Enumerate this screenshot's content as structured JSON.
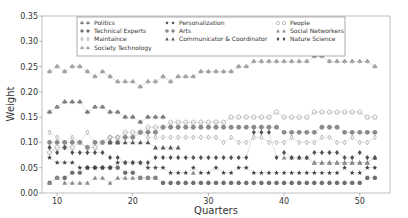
{
  "chart_data": {
    "type": "scatter",
    "title": "",
    "xlabel": "Quarters",
    "ylabel": "Weight",
    "xlim": [
      8,
      54
    ],
    "ylim": [
      0.0,
      0.35
    ],
    "xticks": [
      10,
      20,
      30,
      40,
      50
    ],
    "yticks": [
      0.0,
      0.05,
      0.1,
      0.15,
      0.2,
      0.25,
      0.3,
      0.35
    ],
    "ytick_labels": [
      "0.00",
      "0.05",
      "0.10",
      "0.15",
      "0.20",
      "0.25",
      "0.30",
      "0.35"
    ],
    "grid": false,
    "legend_position": "upper center",
    "x": [
      9,
      10,
      11,
      12,
      13,
      14,
      15,
      16,
      17,
      18,
      19,
      20,
      21,
      22,
      23,
      24,
      25,
      26,
      27,
      28,
      29,
      30,
      31,
      32,
      33,
      34,
      35,
      36,
      37,
      38,
      39,
      40,
      41,
      42,
      43,
      44,
      45,
      46,
      47,
      48,
      49,
      50,
      51,
      52
    ],
    "series": [
      {
        "name": "Politics",
        "marker": "club",
        "color": "#7a7a7a",
        "values": [
          0.16,
          0.17,
          0.18,
          0.18,
          0.18,
          0.16,
          0.17,
          0.17,
          0.16,
          0.16,
          0.15,
          0.15,
          0.14,
          0.15,
          0.15,
          0.15,
          null,
          null,
          null,
          null,
          null,
          null,
          null,
          null,
          null,
          null,
          null,
          null,
          null,
          null,
          null,
          null,
          null,
          null,
          null,
          null,
          null,
          null,
          null,
          null,
          null,
          null,
          null,
          null
        ]
      },
      {
        "name": "Technical Experts",
        "marker": "hexagon",
        "color": "#6e6e6e",
        "values": [
          0.02,
          0.03,
          0.03,
          0.04,
          0.04,
          0.05,
          0.05,
          0.05,
          0.05,
          0.05,
          0.04,
          0.04,
          0.03,
          0.03,
          0.03,
          0.02,
          0.02,
          0.02,
          0.02,
          0.02,
          0.02,
          0.02,
          0.02,
          0.02,
          0.02,
          0.02,
          0.02,
          0.02,
          0.02,
          0.02,
          0.02,
          0.02,
          0.02,
          0.02,
          0.02,
          0.02,
          0.02,
          0.02,
          0.02,
          0.02,
          0.02,
          0.02,
          0.03,
          0.03
        ]
      },
      {
        "name": "Maintaince",
        "marker": "thin-diamond",
        "color": "#999999",
        "values": [
          0.12,
          0.11,
          0.1,
          0.11,
          0.1,
          0.12,
          0.1,
          0.1,
          0.11,
          0.11,
          0.11,
          0.11,
          0.12,
          0.11,
          0.11,
          0.11,
          0.11,
          0.11,
          0.11,
          0.11,
          0.11,
          0.11,
          0.11,
          0.1,
          0.11,
          0.1,
          0.1,
          0.11,
          0.11,
          0.1,
          0.1,
          0.1,
          0.11,
          0.1,
          0.1,
          0.1,
          0.11,
          0.11,
          0.1,
          0.1,
          0.11,
          0.1,
          0.1,
          0.11
        ]
      },
      {
        "name": "Society Technology",
        "marker": "club-light",
        "color": "#a0a0a0",
        "values": [
          0.24,
          0.25,
          0.24,
          0.25,
          0.25,
          0.24,
          0.23,
          0.24,
          0.23,
          0.22,
          0.22,
          0.22,
          0.21,
          0.22,
          0.22,
          0.23,
          0.22,
          0.23,
          0.23,
          0.23,
          0.24,
          0.24,
          0.24,
          0.24,
          0.24,
          0.25,
          0.25,
          0.26,
          0.26,
          0.26,
          0.26,
          0.26,
          0.26,
          0.26,
          0.26,
          0.27,
          0.27,
          0.26,
          0.26,
          0.26,
          0.26,
          0.26,
          0.26,
          0.25
        ]
      },
      {
        "name": "Personalization",
        "marker": "star",
        "color": "#404040",
        "values": [
          0.07,
          0.06,
          0.06,
          0.06,
          0.05,
          0.05,
          0.05,
          0.05,
          0.05,
          0.06,
          0.06,
          0.06,
          0.06,
          0.05,
          0.05,
          0.05,
          0.04,
          0.04,
          0.04,
          0.05,
          0.04,
          0.04,
          0.05,
          0.04,
          0.04,
          0.05,
          0.05,
          0.04,
          0.04,
          0.04,
          0.04,
          0.04,
          0.04,
          0.04,
          0.04,
          0.04,
          0.04,
          0.04,
          0.04,
          0.05,
          0.04,
          0.04,
          0.05,
          0.05
        ]
      },
      {
        "name": "Arts",
        "marker": "circle",
        "color": "#8a8a8a",
        "values": [
          0.1,
          0.1,
          0.1,
          0.1,
          0.1,
          0.09,
          0.1,
          0.1,
          0.1,
          0.1,
          0.11,
          0.11,
          0.12,
          0.12,
          0.12,
          0.13,
          0.13,
          0.13,
          0.13,
          0.13,
          0.13,
          0.13,
          0.13,
          0.13,
          0.13,
          0.13,
          0.13,
          0.13,
          0.13,
          0.13,
          0.13,
          0.12,
          0.12,
          0.12,
          0.12,
          0.12,
          0.13,
          0.13,
          0.13,
          0.12,
          0.12,
          0.12,
          0.12,
          0.12
        ]
      },
      {
        "name": "Communicator & Coordinator",
        "marker": "triangle",
        "color": "#5a5a5a",
        "values": [
          null,
          null,
          null,
          null,
          null,
          null,
          null,
          null,
          0.1,
          0.1,
          0.1,
          0.1,
          0.1,
          0.1,
          0.09,
          0.09,
          0.09,
          0.09,
          null,
          null,
          null,
          null,
          null,
          null,
          null,
          null,
          null,
          null,
          null,
          null,
          null,
          null,
          null,
          null,
          null,
          0.06,
          0.06,
          0.06,
          0.06,
          0.06,
          0.06,
          0.06,
          0.06,
          0.07
        ]
      },
      {
        "name": "People",
        "marker": "pentagon-open",
        "color": "#aaaaaa",
        "values": [
          0.08,
          0.09,
          0.09,
          0.09,
          0.1,
          0.09,
          0.09,
          0.1,
          0.11,
          0.11,
          0.12,
          0.12,
          0.12,
          0.13,
          0.13,
          0.13,
          0.14,
          0.14,
          0.14,
          0.14,
          0.14,
          0.14,
          0.14,
          0.14,
          0.15,
          0.15,
          0.15,
          0.15,
          0.15,
          0.15,
          0.16,
          0.15,
          0.15,
          0.15,
          0.15,
          0.16,
          0.16,
          0.16,
          0.16,
          0.16,
          0.16,
          0.16,
          0.15,
          0.15
        ]
      },
      {
        "name": "Social Networkers",
        "marker": "triangle-light",
        "color": "#8c8c8c",
        "values": [
          0.02,
          0.03,
          0.02,
          0.02,
          0.02,
          0.02,
          0.03,
          0.03,
          0.02,
          0.03,
          0.03,
          0.03,
          0.03,
          0.03,
          0.03,
          null,
          null,
          null,
          null,
          0.04,
          null,
          null,
          null,
          null,
          null,
          null,
          null,
          null,
          null,
          null,
          null,
          0.07,
          0.07,
          0.07,
          0.07,
          0.06,
          0.06,
          0.06,
          0.06,
          0.06,
          0.06,
          0.06,
          0.06,
          0.07
        ]
      },
      {
        "name": "Nature Science",
        "marker": "thick-diamond",
        "color": "#505050",
        "values": [
          0.09,
          0.08,
          0.09,
          0.08,
          0.08,
          0.08,
          0.08,
          0.08,
          0.07,
          0.07,
          0.06,
          0.06,
          0.06,
          0.06,
          0.07,
          0.07,
          0.07,
          0.07,
          0.07,
          0.07,
          0.07,
          0.07,
          0.07,
          0.07,
          0.07,
          0.07,
          0.07,
          0.12,
          0.12,
          0.12,
          0.07,
          0.08,
          0.07,
          0.07,
          0.07,
          0.08,
          0.08,
          0.08,
          0.08,
          0.07,
          0.07,
          0.08,
          0.07,
          0.07
        ]
      }
    ]
  },
  "legend": {
    "columns": [
      [
        "Politics",
        "Technical Experts",
        "Maintaince",
        "Society Technology"
      ],
      [
        "Personalization",
        "Arts",
        "Communicator & Coordinator"
      ],
      [
        "People",
        "Social Networkers",
        "Nature Science"
      ]
    ]
  }
}
